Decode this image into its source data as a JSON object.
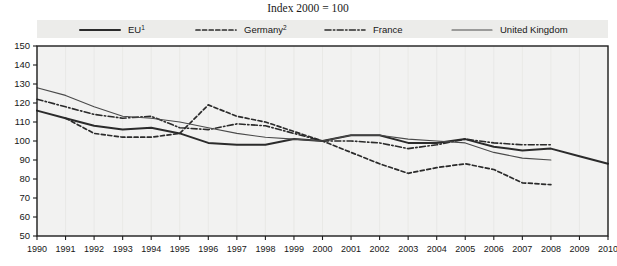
{
  "chart_data": {
    "type": "line",
    "title": "Index 2000 = 100",
    "xlabel": "",
    "ylabel": "",
    "xlim": [
      1990,
      2010
    ],
    "ylim": [
      50,
      150
    ],
    "y_ticks": [
      50,
      60,
      70,
      80,
      90,
      100,
      110,
      120,
      130,
      140,
      150
    ],
    "x": [
      1990,
      1991,
      1992,
      1993,
      1994,
      1995,
      1996,
      1997,
      1998,
      1999,
      2000,
      2001,
      2002,
      2003,
      2004,
      2005,
      2006,
      2007,
      2008,
      2009,
      2010
    ],
    "x_tick_labels": [
      "1990",
      "1991",
      "1992",
      "1993",
      "1994",
      "1995",
      "1996",
      "1997",
      "1998",
      "1999",
      "2000",
      "2001",
      "2002",
      "2003",
      "2004",
      "2005",
      "2006",
      "2007",
      "2008",
      "2009",
      "2010"
    ],
    "grid": false,
    "legend_position": "top",
    "series": [
      {
        "name": "EU",
        "footnote": "1",
        "style": "solid",
        "width": 2.0,
        "color": "#2b2b2b",
        "x": [
          1990,
          1991,
          1992,
          1993,
          1994,
          1995,
          1996,
          1997,
          1998,
          1999,
          2000,
          2001,
          2002,
          2003,
          2004,
          2005,
          2006,
          2007,
          2008,
          2009,
          2010
        ],
        "values": [
          116,
          112,
          108,
          106,
          107,
          104,
          99,
          98,
          98,
          101,
          100,
          103,
          103,
          99,
          99,
          101,
          97,
          95,
          96,
          92,
          88
        ]
      },
      {
        "name": "Germany",
        "footnote": "2",
        "style": "dashed",
        "width": 1.7,
        "color": "#2b2b2b",
        "x": [
          1991,
          1992,
          1993,
          1994,
          1995,
          1996,
          1997,
          1998,
          1999,
          2000,
          2001,
          2002,
          2003,
          2004,
          2005,
          2006,
          2007,
          2008
        ],
        "values": [
          112,
          104,
          102,
          102,
          104,
          119,
          113,
          110,
          105,
          100,
          94,
          88,
          83,
          86,
          88,
          85,
          78,
          77
        ]
      },
      {
        "name": "France",
        "style": "dashdot",
        "width": 1.6,
        "color": "#2b2b2b",
        "x": [
          1990,
          1991,
          1992,
          1993,
          1994,
          1995,
          1996,
          1997,
          1998,
          1999,
          2000,
          2001,
          2002,
          2003,
          2004,
          2005,
          2006,
          2007,
          2008
        ],
        "values": [
          122,
          118,
          114,
          112,
          113,
          107,
          106,
          109,
          108,
          104,
          100,
          100,
          99,
          96,
          98,
          101,
          99,
          98,
          98
        ]
      },
      {
        "name": "United Kingdom",
        "style": "solid-thin",
        "width": 1.1,
        "color": "#4a4a4a",
        "x": [
          1990,
          1991,
          1992,
          1993,
          1994,
          1995,
          1996,
          1997,
          1998,
          1999,
          2000,
          2001,
          2002,
          2003,
          2004,
          2005,
          2006,
          2007,
          2008
        ],
        "values": [
          128,
          124,
          118,
          113,
          112,
          110,
          107,
          104,
          102,
          101,
          100,
          103,
          103,
          101,
          100,
          99,
          94,
          91,
          90
        ]
      }
    ]
  },
  "legend": {
    "items": [
      {
        "label": "EU",
        "sup": "1",
        "style": "solid"
      },
      {
        "label": "Germany",
        "sup": "2",
        "style": "dashed"
      },
      {
        "label": "France",
        "sup": "",
        "style": "dashdot"
      },
      {
        "label": "United Kingdom",
        "sup": "",
        "style": "solid-thin"
      }
    ]
  },
  "colors": {
    "plot_background": "#f2f2f1",
    "legend_background": "#ececea",
    "axis": "#1d1d1d",
    "text": "#171717"
  }
}
